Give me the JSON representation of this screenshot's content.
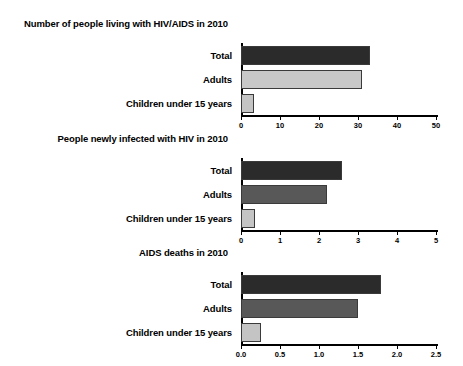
{
  "chart_data": [
    {
      "type": "bar",
      "orientation": "horizontal",
      "title": "Number of people living with HIV/AIDS in 2010",
      "categories": [
        "Total",
        "Adults",
        "Children under 15 years"
      ],
      "values": [
        33.0,
        31.0,
        3.4
      ],
      "xlabel": "",
      "ylabel": "",
      "xlim": [
        0,
        50
      ],
      "xticks": [
        0,
        10,
        20,
        30,
        40,
        50
      ],
      "xticklabels": [
        "0",
        "10",
        "20",
        "30",
        "40",
        "50"
      ],
      "grid": false,
      "legend": false,
      "bar_colors": [
        "#2b2b2b",
        "#c8c8c8",
        "#c4c4c4"
      ]
    },
    {
      "type": "bar",
      "orientation": "horizontal",
      "title": "People newly infected with HIV in 2010",
      "categories": [
        "Total",
        "Adults",
        "Children under 15 years"
      ],
      "values": [
        2.6,
        2.2,
        0.37
      ],
      "xlabel": "",
      "ylabel": "",
      "xlim": [
        0,
        5
      ],
      "xticks": [
        0,
        1,
        2,
        3,
        4,
        5
      ],
      "xticklabels": [
        "0",
        "1",
        "2",
        "3",
        "4",
        "5"
      ],
      "grid": false,
      "legend": false,
      "bar_colors": [
        "#2b2b2b",
        "#585858",
        "#c4c4c4"
      ]
    },
    {
      "type": "bar",
      "orientation": "horizontal",
      "title": "AIDS deaths in 2010",
      "categories": [
        "Total",
        "Adults",
        "Children under 15 years"
      ],
      "values": [
        1.8,
        1.5,
        0.25
      ],
      "xlabel": "Millions",
      "ylabel": "",
      "xlim": [
        0,
        2.5
      ],
      "xticks": [
        0.0,
        0.5,
        1.0,
        1.5,
        2.0,
        2.5
      ],
      "xticklabels": [
        "0.0",
        "0.5",
        "1.0",
        "1.5",
        "2.0",
        "2.5"
      ],
      "grid": false,
      "legend": false,
      "bar_colors": [
        "#2b2b2b",
        "#585858",
        "#c4c4c4"
      ]
    }
  ],
  "figure": {
    "background": "#ffffff",
    "text_color": "#000000",
    "axis_caption": "Millions"
  }
}
